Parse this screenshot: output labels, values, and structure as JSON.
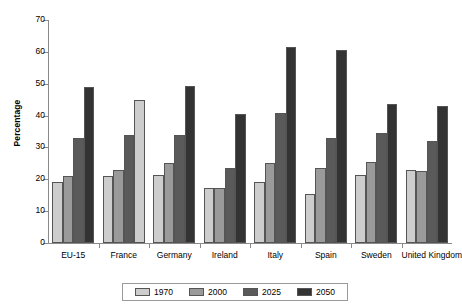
{
  "chart_data": {
    "type": "bar",
    "title": "",
    "xlabel": "",
    "ylabel": "Percentage",
    "ylim": [
      0,
      70
    ],
    "ytick_step": 10,
    "yticks": [
      0,
      10,
      20,
      30,
      40,
      50,
      60,
      70
    ],
    "grid": false,
    "legend_position": "bottom",
    "categories": [
      "EU-15",
      "France",
      "Germany",
      "Ireland",
      "Italy",
      "Spain",
      "Sweden",
      "United Kingdom"
    ],
    "series": [
      {
        "name": "1970",
        "color": "#cdcdcd",
        "values": [
          19.0,
          21.0,
          21.3,
          17.3,
          19.3,
          15.5,
          21.5,
          23.0
        ]
      },
      {
        "name": "2000",
        "color": "#9a9a9a",
        "values": [
          21.0,
          23.0,
          25.0,
          17.3,
          25.0,
          23.5,
          25.5,
          22.5
        ]
      },
      {
        "name": "2025",
        "color": "#5a5a5a",
        "values": [
          33.0,
          33.8,
          34.0,
          23.5,
          40.8,
          33.0,
          34.5,
          32.0
        ]
      },
      {
        "name": "2050",
        "color": "#333333",
        "values": [
          49.0,
          45.0,
          49.3,
          40.5,
          61.5,
          60.5,
          43.5,
          43.0
        ]
      }
    ],
    "bar_color_overrides": [
      {
        "category": "France",
        "series": "2050",
        "color": "#cdcdcd"
      }
    ]
  },
  "legend": {
    "items": [
      {
        "label": "1970",
        "color": "#cdcdcd"
      },
      {
        "label": "2000",
        "color": "#9a9a9a"
      },
      {
        "label": "2025",
        "color": "#5a5a5a"
      },
      {
        "label": "2050",
        "color": "#333333"
      }
    ]
  }
}
